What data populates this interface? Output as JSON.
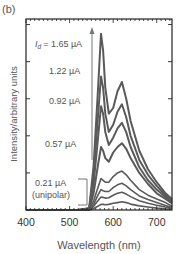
{
  "panel_label": "(b)",
  "chart_data": {
    "type": "line",
    "title": "",
    "panel": "(b)",
    "xlabel": "Wavelength (nm)",
    "ylabel": "Intensity/arbitrary units",
    "xlim": [
      400,
      735
    ],
    "ylim": [
      0,
      5.15
    ],
    "xticks": [
      400,
      500,
      600,
      700
    ],
    "yticks_labeled": false,
    "grid": false,
    "legend": "none",
    "annotations": [
      {
        "text": "I_d = 1.65 µA",
        "label_prefix": "I",
        "label_sub": "d",
        "label_value": "= 1.65 µA"
      },
      {
        "text": "1.22 µA"
      },
      {
        "text": "0.92 µA"
      },
      {
        "text": "0.57 µA"
      },
      {
        "text": "0.21 µA (unipolar)",
        "line1": "0.21 µA",
        "line2": "(unipolar)"
      }
    ],
    "arrow": {
      "x_nm": 550,
      "from": 1.3,
      "to": 4.8,
      "meaning": "increasing drain current I_d"
    },
    "x": [
      400,
      520,
      545,
      555,
      565,
      572,
      577,
      582,
      590,
      600,
      610,
      620,
      630,
      640,
      660,
      680,
      700,
      720,
      735
    ],
    "series": [
      {
        "name": "1.65 µA",
        "values": [
          0,
          0,
          0.05,
          1.2,
          3.2,
          4.75,
          4.3,
          3.3,
          2.6,
          2.75,
          3.2,
          3.45,
          3.0,
          2.4,
          1.6,
          1.1,
          0.75,
          0.45,
          0.3
        ]
      },
      {
        "name": "1.22 µA",
        "values": [
          0,
          0,
          0.04,
          0.9,
          2.5,
          3.6,
          3.3,
          2.6,
          2.1,
          2.3,
          2.65,
          2.85,
          2.5,
          2.0,
          1.35,
          0.95,
          0.65,
          0.4,
          0.25
        ]
      },
      {
        "name": "0.92 µA",
        "values": [
          0,
          0,
          0.03,
          0.7,
          1.9,
          2.8,
          2.6,
          2.1,
          1.75,
          1.95,
          2.2,
          2.35,
          2.1,
          1.7,
          1.15,
          0.8,
          0.55,
          0.35,
          0.2
        ]
      },
      {
        "name": "0.57 µA",
        "values": [
          0,
          0,
          0.02,
          0.45,
          1.2,
          1.7,
          1.6,
          1.4,
          1.3,
          1.55,
          1.7,
          1.8,
          1.65,
          1.4,
          1.0,
          0.7,
          0.45,
          0.3,
          0.18
        ]
      },
      {
        "name": "0.40 µA",
        "values": [
          0,
          0,
          0.01,
          0.25,
          0.6,
          0.85,
          0.8,
          0.75,
          0.75,
          0.9,
          1.0,
          1.05,
          0.95,
          0.8,
          0.55,
          0.4,
          0.3,
          0.2,
          0.1
        ]
      },
      {
        "name": "0.30 µA",
        "values": [
          0,
          0,
          0.01,
          0.15,
          0.4,
          0.55,
          0.52,
          0.5,
          0.5,
          0.6,
          0.68,
          0.72,
          0.65,
          0.55,
          0.38,
          0.28,
          0.2,
          0.12,
          0.07
        ]
      },
      {
        "name": "0.25 µA",
        "values": [
          0,
          0,
          0,
          0.1,
          0.25,
          0.35,
          0.34,
          0.32,
          0.33,
          0.4,
          0.45,
          0.48,
          0.43,
          0.36,
          0.25,
          0.18,
          0.13,
          0.08,
          0.05
        ]
      },
      {
        "name": "0.21 µA (unipolar)",
        "values": [
          0,
          0,
          0,
          0.04,
          0.1,
          0.15,
          0.15,
          0.14,
          0.15,
          0.18,
          0.2,
          0.22,
          0.2,
          0.16,
          0.11,
          0.08,
          0.05,
          0.03,
          0.02
        ]
      }
    ],
    "line_color": "#5a5a5a",
    "axis_color": "#222222",
    "annotation_color": "#666666"
  }
}
